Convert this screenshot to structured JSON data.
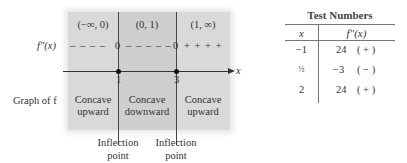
{
  "diagram": {
    "intervals": [
      "(−∞, 0)",
      "(0, 1)",
      "(1, ∞)"
    ],
    "sign_row_label": "f″(x)",
    "sign_row": {
      "seg1": "– – – –",
      "zero1": "0",
      "seg2": "– – – – –",
      "zero2": "0",
      "seg3": "+ + + +"
    },
    "axis_label": "x",
    "ticks": [
      "1",
      "3"
    ],
    "graph_row_label": "Graph of f",
    "concavity": [
      {
        "line1": "Concave",
        "line2": "upward"
      },
      {
        "line1": "Concave",
        "line2": "downward"
      },
      {
        "line1": "Concave",
        "line2": "upward"
      }
    ],
    "annotations": [
      {
        "line1": "Inflection",
        "line2": "point"
      },
      {
        "line1": "Inflection",
        "line2": "point"
      }
    ],
    "colors": {
      "region": "#d9d9d9",
      "middle_region": "#cfcfcf"
    }
  },
  "table": {
    "title": "Test Numbers",
    "headers": [
      "x",
      "f″(x)"
    ],
    "rows": [
      {
        "x": "−1",
        "value": "24",
        "sign": "( + )"
      },
      {
        "x": "½",
        "value": "−3",
        "sign": "( − )"
      },
      {
        "x": "2",
        "value": "24",
        "sign": "( + )"
      }
    ]
  }
}
